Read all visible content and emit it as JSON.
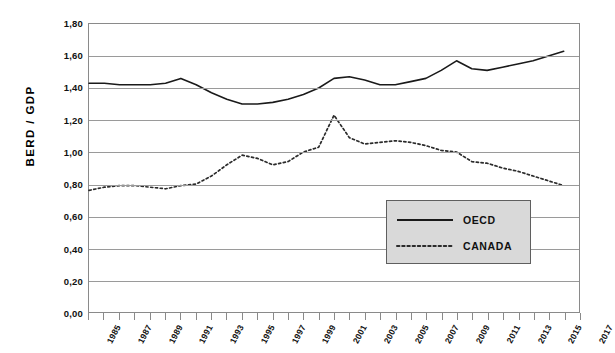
{
  "chart_data": {
    "type": "line",
    "title": "",
    "xlabel": "",
    "ylabel": "BERD / GDP",
    "ylim": [
      0.0,
      1.8
    ],
    "xlim": [
      1985,
      2017
    ],
    "grid": true,
    "legend_position": "inside-bottom-right",
    "y_ticks": [
      "0,00",
      "0,20",
      "0,40",
      "0,60",
      "0,80",
      "1,00",
      "1,20",
      "1,40",
      "1,60",
      "1,80"
    ],
    "y_tick_values": [
      0.0,
      0.2,
      0.4,
      0.6,
      0.8,
      1.0,
      1.2,
      1.4,
      1.6,
      1.8
    ],
    "x_tick_labels": [
      "1985",
      "1987",
      "1989",
      "1991",
      "1993",
      "1995",
      "1997",
      "1999",
      "2001",
      "2003",
      "2005",
      "2007",
      "2009",
      "2011",
      "2013",
      "2015",
      "2017"
    ],
    "x": [
      1985,
      1986,
      1987,
      1988,
      1989,
      1990,
      1991,
      1992,
      1993,
      1994,
      1995,
      1996,
      1997,
      1998,
      1999,
      2000,
      2001,
      2002,
      2003,
      2004,
      2005,
      2006,
      2007,
      2008,
      2009,
      2010,
      2011,
      2012,
      2013,
      2014,
      2015,
      2016
    ],
    "series": [
      {
        "name": "OECD",
        "style": "solid",
        "color": "#1a1a1a",
        "values": [
          1.43,
          1.43,
          1.42,
          1.42,
          1.42,
          1.43,
          1.46,
          1.42,
          1.37,
          1.33,
          1.3,
          1.3,
          1.31,
          1.33,
          1.36,
          1.4,
          1.46,
          1.47,
          1.45,
          1.42,
          1.42,
          1.44,
          1.46,
          1.51,
          1.57,
          1.52,
          1.51,
          1.53,
          1.55,
          1.57,
          1.6,
          1.63
        ]
      },
      {
        "name": "CANADA",
        "style": "dotted",
        "color": "#2b2b2b",
        "values": [
          0.76,
          0.78,
          0.79,
          0.79,
          0.78,
          0.77,
          0.79,
          0.8,
          0.85,
          0.92,
          0.98,
          0.96,
          0.92,
          0.94,
          1.0,
          1.03,
          1.23,
          1.09,
          1.05,
          1.06,
          1.07,
          1.06,
          1.04,
          1.01,
          1.0,
          0.94,
          0.93,
          0.9,
          0.88,
          0.85,
          0.82,
          0.79
        ]
      }
    ]
  },
  "legend": {
    "items": [
      {
        "label": "OECD",
        "style": "solid"
      },
      {
        "label": "CANADA",
        "style": "dotted"
      }
    ]
  },
  "axis": {
    "y_title": "BERD / GDP"
  }
}
